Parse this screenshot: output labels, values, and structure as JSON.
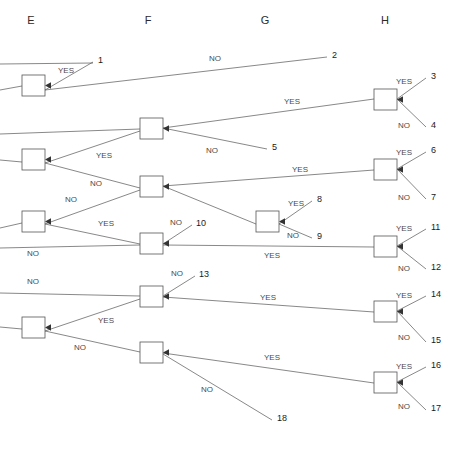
{
  "diagram": {
    "type": "decision-tree",
    "width": 463,
    "height": 451,
    "background_color": "#ffffff",
    "line_color": "#555555",
    "text_color": "#2b2b2b",
    "columns": [
      {
        "id": "E",
        "label": "E",
        "x": 31,
        "y": 24
      },
      {
        "id": "F",
        "label": "F",
        "x": 148,
        "y": 24
      },
      {
        "id": "G",
        "label": "G",
        "x": 265,
        "y": 24
      },
      {
        "id": "H",
        "label": "H",
        "x": 385,
        "y": 24
      }
    ],
    "nodes": [
      {
        "id": "E1",
        "column": "E",
        "x": 22,
        "y": 75,
        "w": 23,
        "h": 21
      },
      {
        "id": "E2",
        "column": "E",
        "x": 22,
        "y": 149,
        "w": 23,
        "h": 21
      },
      {
        "id": "E3",
        "column": "E",
        "x": 22,
        "y": 211,
        "w": 23,
        "h": 21
      },
      {
        "id": "E4",
        "column": "E",
        "x": 22,
        "y": 317,
        "w": 23,
        "h": 21
      },
      {
        "id": "F1",
        "column": "F",
        "x": 140,
        "y": 118,
        "w": 23,
        "h": 21
      },
      {
        "id": "F2",
        "column": "F",
        "x": 140,
        "y": 176,
        "w": 23,
        "h": 21
      },
      {
        "id": "F3",
        "column": "F",
        "x": 140,
        "y": 233,
        "w": 23,
        "h": 21
      },
      {
        "id": "F4",
        "column": "F",
        "x": 140,
        "y": 286,
        "w": 23,
        "h": 21
      },
      {
        "id": "F5",
        "column": "F",
        "x": 140,
        "y": 342,
        "w": 23,
        "h": 21
      },
      {
        "id": "G1",
        "column": "G",
        "x": 256,
        "y": 211,
        "w": 23,
        "h": 21
      },
      {
        "id": "H1",
        "column": "H",
        "x": 374,
        "y": 89,
        "w": 23,
        "h": 21
      },
      {
        "id": "H2",
        "column": "H",
        "x": 374,
        "y": 159,
        "w": 23,
        "h": 21
      },
      {
        "id": "H3",
        "column": "H",
        "x": 374,
        "y": 236,
        "w": 23,
        "h": 21
      },
      {
        "id": "H4",
        "column": "H",
        "x": 374,
        "y": 301,
        "w": 23,
        "h": 21
      },
      {
        "id": "H5",
        "column": "H",
        "x": 374,
        "y": 372,
        "w": 23,
        "h": 21
      }
    ],
    "branch_labels": [
      {
        "text": "YES",
        "x": 66,
        "y": 73
      },
      {
        "text": "NO",
        "x": 215,
        "y": 61
      },
      {
        "text": "YES",
        "x": 292,
        "y": 104
      },
      {
        "text": "YES",
        "x": 404,
        "y": 84
      },
      {
        "text": "NO",
        "x": 404,
        "y": 128
      },
      {
        "text": "YES",
        "x": 104,
        "y": 158
      },
      {
        "text": "NO",
        "x": 212,
        "y": 153
      },
      {
        "text": "YES",
        "x": 300,
        "y": 172
      },
      {
        "text": "YES",
        "x": 404,
        "y": 155
      },
      {
        "text": "NO",
        "x": 404,
        "y": 200
      },
      {
        "text": "NO",
        "x": 96,
        "y": 186
      },
      {
        "text": "NO",
        "x": 71,
        "y": 202
      },
      {
        "text": "YES",
        "x": 106,
        "y": 226
      },
      {
        "text": "YES",
        "x": 296,
        "y": 206
      },
      {
        "text": "NO",
        "x": 293,
        "y": 238
      },
      {
        "text": "NO",
        "x": 176,
        "y": 225
      },
      {
        "text": "NO",
        "x": 33,
        "y": 256
      },
      {
        "text": "YES",
        "x": 272,
        "y": 258
      },
      {
        "text": "YES",
        "x": 404,
        "y": 231
      },
      {
        "text": "NO",
        "x": 404,
        "y": 271
      },
      {
        "text": "NO",
        "x": 33,
        "y": 284
      },
      {
        "text": "NO",
        "x": 177,
        "y": 276
      },
      {
        "text": "YES",
        "x": 106,
        "y": 323
      },
      {
        "text": "YES",
        "x": 268,
        "y": 300
      },
      {
        "text": "YES",
        "x": 404,
        "y": 298
      },
      {
        "text": "NO",
        "x": 404,
        "y": 340
      },
      {
        "text": "NO",
        "x": 80,
        "y": 350
      },
      {
        "text": "YES",
        "x": 272,
        "y": 360
      },
      {
        "text": "NO",
        "x": 207,
        "y": 392
      },
      {
        "text": "YES",
        "x": 404,
        "y": 369
      },
      {
        "text": "NO",
        "x": 404,
        "y": 409
      }
    ],
    "leaves": [
      {
        "id": "1",
        "label": "1",
        "x": 98,
        "y": 63
      },
      {
        "id": "2",
        "label": "2",
        "x": 332,
        "y": 58
      },
      {
        "id": "3",
        "label": "3",
        "x": 431,
        "y": 79
      },
      {
        "id": "4",
        "label": "4",
        "x": 431,
        "y": 128
      },
      {
        "id": "5",
        "label": "5",
        "x": 272,
        "y": 150
      },
      {
        "id": "6",
        "label": "6",
        "x": 431,
        "y": 153
      },
      {
        "id": "7",
        "label": "7",
        "x": 431,
        "y": 200
      },
      {
        "id": "8",
        "label": "8",
        "x": 317,
        "y": 202
      },
      {
        "id": "9",
        "label": "9",
        "x": 317,
        "y": 239
      },
      {
        "id": "10",
        "label": "10",
        "x": 196,
        "y": 226
      },
      {
        "id": "11",
        "label": "11",
        "x": 431,
        "y": 230
      },
      {
        "id": "12",
        "label": "12",
        "x": 431,
        "y": 270
      },
      {
        "id": "13",
        "label": "13",
        "x": 199,
        "y": 277
      },
      {
        "id": "14",
        "label": "14",
        "x": 431,
        "y": 297
      },
      {
        "id": "15",
        "label": "15",
        "x": 431,
        "y": 343
      },
      {
        "id": "16",
        "label": "16",
        "x": 431,
        "y": 368
      },
      {
        "id": "17",
        "label": "17",
        "x": 431,
        "y": 411
      },
      {
        "id": "18",
        "label": "18",
        "x": 277,
        "y": 421
      }
    ],
    "edges": [
      {
        "from": "E1",
        "to": "leaf-1",
        "label": "YES",
        "path": "M 45 90 L 93 62"
      },
      {
        "from": "E1-in-top",
        "to": "leaf-1",
        "label": "",
        "path": "M 0 64 L 93 63"
      },
      {
        "from": "E1",
        "to": "leaf-2",
        "label": "NO",
        "path": "M 45 90 L 327 57"
      },
      {
        "from": "left",
        "to": "E1",
        "label": "",
        "path": "M 0 90 L 22 86"
      },
      {
        "from": "F1",
        "to": "H1",
        "label": "YES",
        "path": "M 163 128 L 374 99"
      },
      {
        "from": "F1",
        "to": "leaf-5",
        "label": "NO",
        "path": "M 163 128 L 267 149"
      },
      {
        "from": "left",
        "to": "F1",
        "label": "",
        "path": "M 0 134 L 140 129"
      },
      {
        "from": "H1",
        "to": "leaf-3",
        "label": "YES",
        "path": "M 397 99 L 426 78"
      },
      {
        "from": "H1",
        "to": "leaf-4",
        "label": "NO",
        "path": "M 397 99 L 426 127"
      },
      {
        "from": "E2",
        "to": "F1",
        "label": "YES",
        "path": "M 45 163 L 140 131"
      },
      {
        "from": "E2",
        "to": "F2",
        "label": "NO",
        "path": "M 45 163 L 140 188"
      },
      {
        "from": "left",
        "to": "E2",
        "label": "",
        "path": "M 0 160 L 22 162"
      },
      {
        "from": "F2",
        "to": "H2",
        "label": "YES",
        "path": "M 163 186 L 374 170"
      },
      {
        "from": "F2",
        "to": "G1",
        "label": "NO",
        "path": "M 163 186 L 256 224"
      },
      {
        "from": "H2",
        "to": "leaf-6",
        "label": "YES",
        "path": "M 397 169 L 426 152"
      },
      {
        "from": "H2",
        "to": "leaf-7",
        "label": "NO",
        "path": "M 397 169 L 426 199"
      },
      {
        "from": "G1",
        "to": "leaf-8",
        "label": "YES",
        "path": "M 279 224 L 312 201"
      },
      {
        "from": "G1",
        "to": "leaf-9",
        "label": "NO",
        "path": "M 279 224 L 312 238"
      },
      {
        "from": "E3",
        "to": "F2",
        "label": "NO",
        "path": "M 45 224 L 140 190"
      },
      {
        "from": "E3",
        "to": "F3",
        "label": "YES",
        "path": "M 45 224 L 140 244"
      },
      {
        "from": "left",
        "to": "E3",
        "label": "",
        "path": "M 0 228 L 22 223"
      },
      {
        "from": "F3",
        "to": "leaf-10",
        "label": "NO",
        "path": "M 163 244 L 192 225"
      },
      {
        "from": "F3",
        "to": "H3",
        "label": "YES",
        "path": "M 163 245 L 374 247"
      },
      {
        "from": "left",
        "to": "F3",
        "label": "NO",
        "path": "M 0 248 L 140 245"
      },
      {
        "from": "H3",
        "to": "leaf-11",
        "label": "YES",
        "path": "M 397 246 L 426 229"
      },
      {
        "from": "H3",
        "to": "leaf-12",
        "label": "NO",
        "path": "M 397 246 L 426 269"
      },
      {
        "from": "left",
        "to": "F4",
        "label": "NO",
        "path": "M 0 293 L 140 296"
      },
      {
        "from": "F4",
        "to": "leaf-13",
        "label": "NO",
        "path": "M 163 296 L 195 276"
      },
      {
        "from": "F4",
        "to": "H4",
        "label": "YES",
        "path": "M 163 297 L 374 312"
      },
      {
        "from": "E4",
        "to": "F4",
        "label": "YES",
        "path": "M 45 331 L 140 299"
      },
      {
        "from": "E4",
        "to": "F5",
        "label": "NO",
        "path": "M 45 331 L 140 352"
      },
      {
        "from": "left",
        "to": "E4",
        "label": "",
        "path": "M 0 327 L 22 329"
      },
      {
        "from": "H4",
        "to": "leaf-14",
        "label": "YES",
        "path": "M 397 311 L 426 296"
      },
      {
        "from": "H4",
        "to": "leaf-15",
        "label": "NO",
        "path": "M 397 311 L 426 342"
      },
      {
        "from": "F5",
        "to": "H5",
        "label": "YES",
        "path": "M 163 353 L 374 383"
      },
      {
        "from": "F5",
        "to": "leaf-18",
        "label": "NO",
        "path": "M 163 354 L 272 420"
      },
      {
        "from": "H5",
        "to": "leaf-16",
        "label": "YES",
        "path": "M 397 382 L 426 367"
      },
      {
        "from": "H5",
        "to": "leaf-17",
        "label": "NO",
        "path": "M 397 382 L 426 410"
      }
    ]
  },
  "chart_data": {
    "type": "diagram",
    "title": "",
    "column_labels": [
      "E",
      "F",
      "G",
      "H"
    ],
    "leaf_outcomes": [
      "1",
      "2",
      "3",
      "4",
      "5",
      "6",
      "7",
      "8",
      "9",
      "10",
      "11",
      "12",
      "13",
      "14",
      "15",
      "16",
      "17",
      "18"
    ],
    "branch_values": [
      "YES",
      "NO"
    ],
    "node_counts": {
      "E": 4,
      "F": 5,
      "G": 1,
      "H": 5
    },
    "total_nodes": 15,
    "total_leaves": 18
  }
}
